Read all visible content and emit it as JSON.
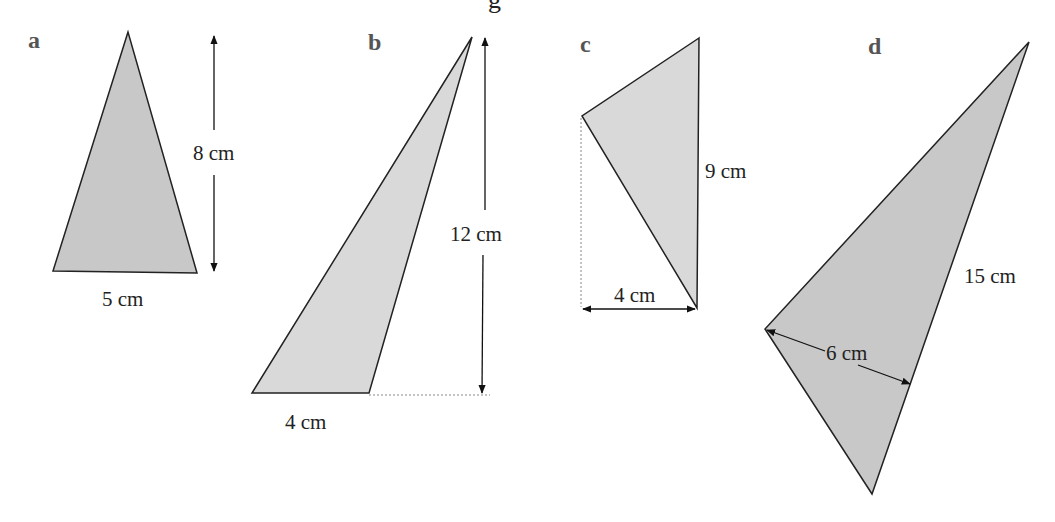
{
  "header": {
    "partial_title_fragment": "g"
  },
  "colors": {
    "fill_dark": "#c8c8c8",
    "fill_light": "#d9d9d9",
    "stroke": "#222222",
    "letter": "#555555"
  },
  "figures": [
    {
      "letter": "a",
      "base_label": "5 cm",
      "height_label": "8 cm"
    },
    {
      "letter": "b",
      "base_label": "4 cm",
      "height_label": "12 cm"
    },
    {
      "letter": "c",
      "base_label": "4 cm",
      "height_label": "9 cm"
    },
    {
      "letter": "d",
      "base_label": "6 cm",
      "height_label": "15 cm"
    }
  ]
}
